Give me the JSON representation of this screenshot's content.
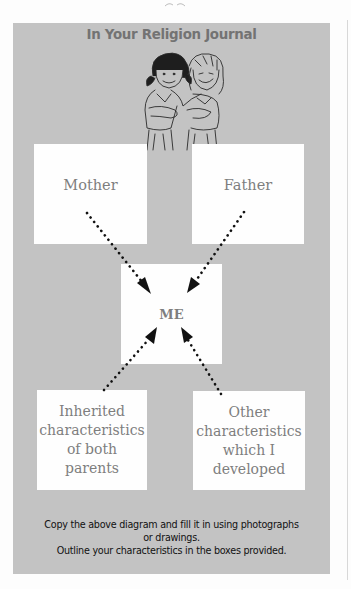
{
  "page": {
    "header": {
      "title": "In Your Religion Journal",
      "illustration": "two-children-illustration"
    },
    "diagram": {
      "boxes": {
        "mother": {
          "label": "Mother"
        },
        "father": {
          "label": "Father"
        },
        "me": {
          "label": "ME"
        },
        "inherited": {
          "lines": [
            "Inherited",
            "characteristics",
            "of both",
            "parents"
          ]
        },
        "other": {
          "lines": [
            "Other",
            "characteristics",
            "which I",
            "developed"
          ]
        }
      },
      "arrows": [
        {
          "from": "mother",
          "to": "me",
          "style": "dotted"
        },
        {
          "from": "father",
          "to": "me",
          "style": "dotted"
        },
        {
          "from": "inherited",
          "to": "me",
          "style": "dotted"
        },
        {
          "from": "other",
          "to": "me",
          "style": "dotted"
        }
      ]
    },
    "instructions": {
      "line1": "Copy the above diagram and fill it in using photographs",
      "line2": "or drawings.",
      "line3": "Outline your characteristics in the boxes provided."
    },
    "colors": {
      "panel": "#c3c3c3",
      "box": "#fefefe",
      "title": "#737373",
      "box_text": "#7e7e7e",
      "arrow": "#111111"
    }
  }
}
